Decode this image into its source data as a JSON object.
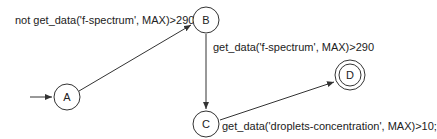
{
  "states": [
    {
      "id": "A",
      "label": "A",
      "initial": true,
      "final": false
    },
    {
      "id": "B",
      "label": "B",
      "initial": false,
      "final": false
    },
    {
      "id": "C",
      "label": "C",
      "initial": false,
      "final": false
    },
    {
      "id": "D",
      "label": "D",
      "initial": false,
      "final": true
    }
  ],
  "transitions": [
    {
      "from": "A",
      "to": "B",
      "label": "not get_data('f-spectrum', MAX)>290"
    },
    {
      "from": "B",
      "to": "C",
      "label": "get_data('f-spectrum', MAX)>290"
    },
    {
      "from": "C",
      "to": "D",
      "label": "get_data('droplets-concentration', MAX)>10;"
    }
  ]
}
